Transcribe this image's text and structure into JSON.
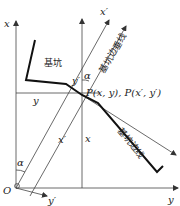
{
  "diagram": {
    "labels": {
      "x_axis": "x",
      "y_axis": "y",
      "origin": "O",
      "x_prime_axis": "x′",
      "y_prime_axis": "y′",
      "alpha_top": "α",
      "alpha_bottom": "α",
      "y_segment": "y",
      "y_prime_segment": "y′",
      "x_prime_segment": "x′",
      "x_segment": "x",
      "point_p": "P(x, y), P(x′, y′)",
      "pit": "基坑",
      "pit_edge_perpendicular": "基坑边垂线",
      "pit_edge": "基坑边线"
    },
    "colors": {
      "line": "#444444",
      "pit_edge": "#111111",
      "background": "#ffffff"
    }
  }
}
